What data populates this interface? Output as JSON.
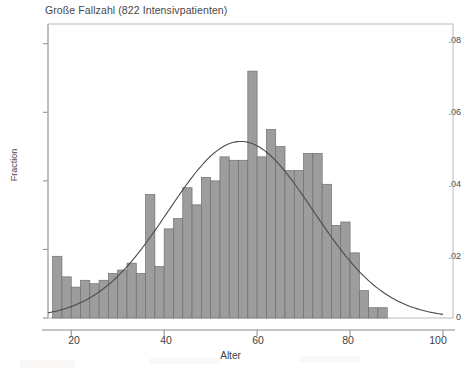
{
  "chart_data": {
    "type": "bar",
    "title": "Große Fallzahl (822 Intensivpatienten)",
    "subtitle": "",
    "xlabel": "Alter",
    "ylabel": "Fraction",
    "xlim": [
      15,
      100
    ],
    "ylim": [
      0,
      0.084
    ],
    "xticks": [
      20,
      40,
      60,
      80,
      100
    ],
    "xtick_labels": [
      "20",
      "40",
      "60",
      "80",
      "100"
    ],
    "yticks": [
      0,
      0.02,
      0.04,
      0.06,
      0.08
    ],
    "ytick_labels": [
      "0",
      ".02",
      ".04",
      ".06",
      ".08"
    ],
    "grid": false,
    "legend": null,
    "bin_width": 2,
    "n_observations": 822,
    "bin_starts": [
      16,
      18,
      20,
      22,
      24,
      26,
      28,
      30,
      32,
      34,
      36,
      38,
      40,
      42,
      44,
      46,
      48,
      50,
      52,
      54,
      56,
      58,
      60,
      62,
      64,
      66,
      68,
      70,
      72,
      74,
      76,
      78,
      80,
      82,
      84,
      86
    ],
    "categories": [
      "16",
      "18",
      "20",
      "22",
      "24",
      "26",
      "28",
      "30",
      "32",
      "34",
      "36",
      "38",
      "40",
      "42",
      "44",
      "46",
      "48",
      "50",
      "52",
      "54",
      "56",
      "58",
      "60",
      "62",
      "64",
      "66",
      "68",
      "70",
      "72",
      "74",
      "76",
      "78",
      "80",
      "82",
      "84",
      "86"
    ],
    "values": [
      0.018,
      0.012,
      0.009,
      0.011,
      0.01,
      0.011,
      0.013,
      0.014,
      0.016,
      0.013,
      0.036,
      0.015,
      0.026,
      0.029,
      0.038,
      0.033,
      0.041,
      0.04,
      0.047,
      0.046,
      0.046,
      0.072,
      0.047,
      0.055,
      0.05,
      0.043,
      0.043,
      0.048,
      0.048,
      0.039,
      0.027,
      0.028,
      0.019,
      0.008,
      0.003,
      0.003
    ],
    "overlay": {
      "name": "normal density",
      "type": "line",
      "mean": 56.5,
      "sd": 15.6,
      "peak_value": 0.0515,
      "peak_x": 56.5,
      "x_start": 15,
      "x_end": 100
    }
  },
  "axes": {
    "y_title": "Fraction",
    "x_title": "Alter"
  },
  "header": {
    "title": "Große Fallzahl (822 Intensivpatienten)"
  }
}
